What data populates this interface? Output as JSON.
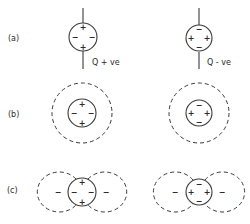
{
  "figure": {
    "panels": [
      {
        "label": "(a)",
        "description": "Quadrupole charge arrangements on a line",
        "items": [
          {
            "name": "positive-quadrupole",
            "annotation": "Q + ve",
            "signs": {
              "top": "+",
              "bottom": "+",
              "left": "−",
              "right": "−"
            }
          },
          {
            "name": "negative-quadrupole",
            "annotation": "Q - ve",
            "signs": {
              "top": "−",
              "bottom": "−",
              "left": "+",
              "right": "+"
            }
          }
        ]
      },
      {
        "label": "(b)",
        "description": "Quadrupoles surrounded by spherical dashed boundary",
        "items": [
          {
            "name": "positive-quadrupole-sphere",
            "signs": {
              "top": "+",
              "bottom": "+",
              "left": "−",
              "right": "−"
            }
          },
          {
            "name": "negative-quadrupole-sphere",
            "signs": {
              "top": "−",
              "bottom": "−",
              "left": "+",
              "right": "+"
            }
          }
        ]
      },
      {
        "label": "(c)",
        "description": "Quadrupoles with two dashed side lobes carrying negative charge",
        "items": [
          {
            "name": "positive-quadrupole-lobes",
            "signs": {
              "top": "+",
              "bottom": "+",
              "left": "−",
              "right": "−"
            },
            "lobe_signs": {
              "left": "−",
              "right": "−"
            }
          },
          {
            "name": "negative-quadrupole-lobes",
            "signs": {
              "top": "−",
              "bottom": "−",
              "left": "+",
              "right": "+"
            },
            "lobe_signs": {
              "left": "−",
              "right": "−"
            }
          }
        ]
      }
    ]
  }
}
